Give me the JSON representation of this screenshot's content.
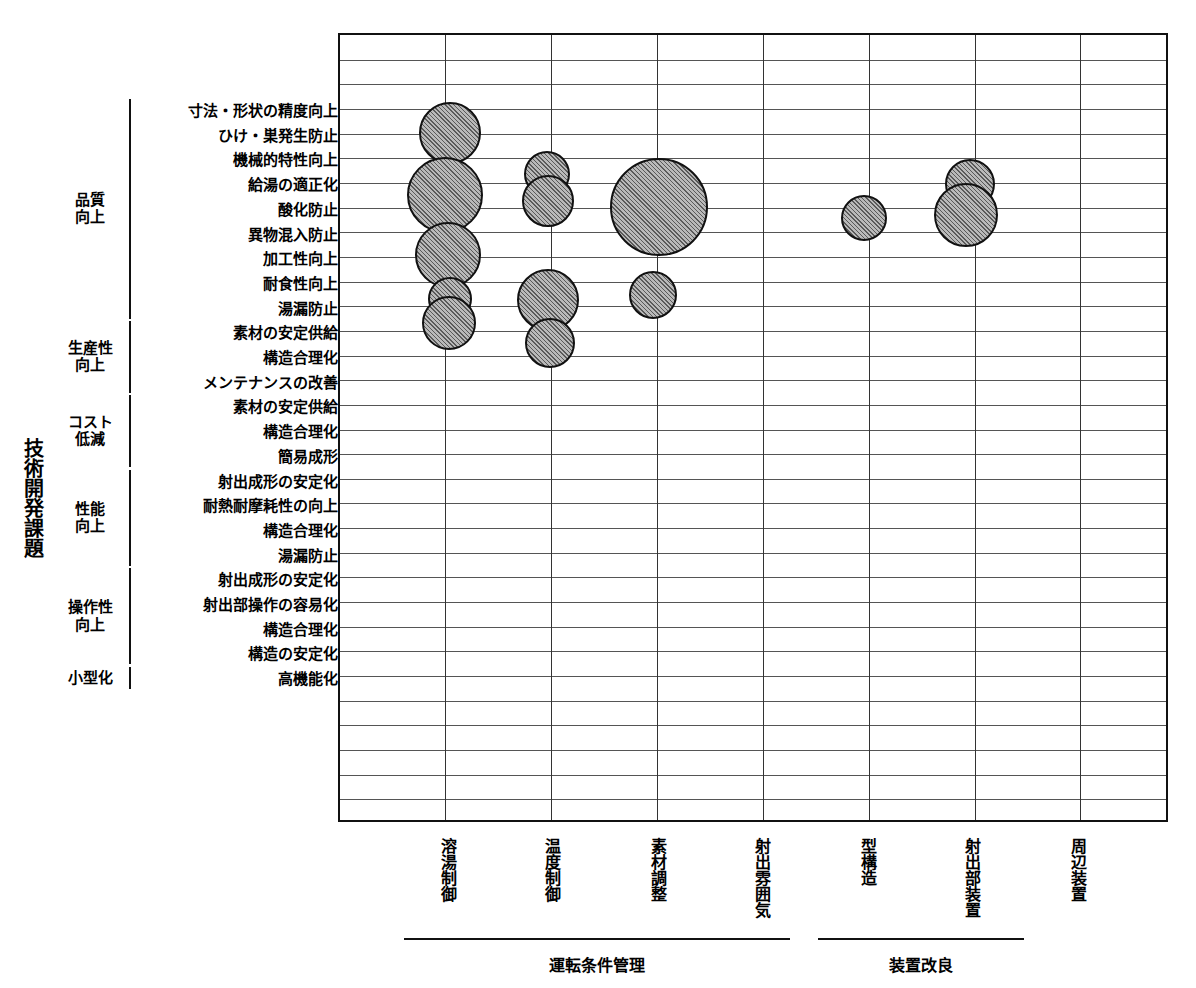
{
  "axis": {
    "y_title": "技術開発課題"
  },
  "row_groups": [
    {
      "label": "品質\n向上",
      "start_row": 1,
      "end_row": 9
    },
    {
      "label": "生産性\n向上",
      "start_row": 10,
      "end_row": 12
    },
    {
      "label": "コスト\n低減",
      "start_row": 13,
      "end_row": 15
    },
    {
      "label": "性能\n向上",
      "start_row": 16,
      "end_row": 19
    },
    {
      "label": "操作性\n向上",
      "start_row": 20,
      "end_row": 23
    },
    {
      "label": "小型化",
      "start_row": 24,
      "end_row": 24
    }
  ],
  "rows": [
    {
      "index": 1,
      "label": "寸法・形状の精度向上"
    },
    {
      "index": 2,
      "label": "ひけ・巣発生防止"
    },
    {
      "index": 3,
      "label": "機械的特性向上"
    },
    {
      "index": 4,
      "label": "給湯の適正化"
    },
    {
      "index": 5,
      "label": "酸化防止"
    },
    {
      "index": 6,
      "label": "異物混入防止"
    },
    {
      "index": 7,
      "label": "加工性向上"
    },
    {
      "index": 8,
      "label": "耐食性向上"
    },
    {
      "index": 9,
      "label": "湯漏防止"
    },
    {
      "index": 10,
      "label": "素材の安定供給"
    },
    {
      "index": 11,
      "label": "構造合理化"
    },
    {
      "index": 12,
      "label": "メンテナンスの改善"
    },
    {
      "index": 13,
      "label": "素材の安定供給"
    },
    {
      "index": 14,
      "label": "構造合理化"
    },
    {
      "index": 15,
      "label": "簡易成形"
    },
    {
      "index": 16,
      "label": "射出成形の安定化"
    },
    {
      "index": 17,
      "label": "耐熱耐摩耗性の向上"
    },
    {
      "index": 18,
      "label": "構造合理化"
    },
    {
      "index": 19,
      "label": "湯漏防止"
    },
    {
      "index": 20,
      "label": "射出成形の安定化"
    },
    {
      "index": 21,
      "label": "射出部操作の容易化"
    },
    {
      "index": 22,
      "label": "構造合理化"
    },
    {
      "index": 23,
      "label": "構造の安定化"
    },
    {
      "index": 24,
      "label": "高機能化"
    }
  ],
  "columns": [
    {
      "index": 1,
      "label": "溶湯制御"
    },
    {
      "index": 2,
      "label": "温度制御"
    },
    {
      "index": 3,
      "label": "素材調整"
    },
    {
      "index": 4,
      "label": "射出雰囲気"
    },
    {
      "index": 5,
      "label": "型構造"
    },
    {
      "index": 6,
      "label": "射出部装置"
    },
    {
      "index": 7,
      "label": "周辺装置"
    }
  ],
  "column_groups": [
    {
      "label": "運転条件管理",
      "start_col": 1,
      "end_col": 4
    },
    {
      "label": "装置改良",
      "start_col": 5,
      "end_col": 6
    }
  ],
  "chart_data": {
    "type": "scatter",
    "title": "",
    "xlabel": "",
    "ylabel": "技術開発課題",
    "grid": true,
    "legend": "none",
    "note": "bubble-matrix: bubble area encodes number of patent applications per (課題 row × 手段 column) cell",
    "categories_x": [
      "溶湯制御",
      "温度制御",
      "素材調整",
      "射出雰囲気",
      "型構造",
      "射出部装置",
      "周辺装置"
    ],
    "categories_y": [
      "寸法・形状の精度向上",
      "ひけ・巣発生防止",
      "機械的特性向上",
      "給湯の適正化",
      "酸化防止",
      "異物混入防止",
      "加工性向上",
      "耐食性向上",
      "湯漏防止",
      "素材の安定供給",
      "構造合理化",
      "メンテナンスの改善",
      "素材の安定供給",
      "構造合理化",
      "簡易成形",
      "射出成形の安定化",
      "耐熱耐摩耗性の向上",
      "構造合理化",
      "湯漏防止",
      "射出成形の安定化",
      "射出部操作の容易化",
      "構造合理化",
      "構造の安定化",
      "高機能化"
    ],
    "bubbles": [
      {
        "x": "溶湯制御",
        "y": "寸法・形状の精度向上",
        "col": 1,
        "row": 1,
        "r": 31,
        "cx": 448,
        "cy": 131
      },
      {
        "x": "溶湯制御",
        "y": "機械的特性向上",
        "col": 1,
        "row": 3,
        "r": 38,
        "cx": 443,
        "cy": 193
      },
      {
        "x": "溶湯制御",
        "y": "酸化防止",
        "col": 1,
        "row": 5,
        "r": 33,
        "cx": 446,
        "cy": 253
      },
      {
        "x": "溶湯制御",
        "y": "加工性向上",
        "col": 1,
        "row": 7,
        "r": 22,
        "cx": 448,
        "cy": 297
      },
      {
        "x": "溶湯制御",
        "y": "湯漏防止",
        "col": 1,
        "row": 9,
        "r": 27,
        "cx": 447,
        "cy": 321
      },
      {
        "x": "温度制御",
        "y": "ひけ・巣発生防止",
        "col": 2,
        "row": 2,
        "r": 23,
        "cx": 545,
        "cy": 172
      },
      {
        "x": "温度制御",
        "y": "給湯の適正化",
        "col": 2,
        "row": 4,
        "r": 26,
        "cx": 546,
        "cy": 199
      },
      {
        "x": "温度制御",
        "y": "加工性向上",
        "col": 2,
        "row": 7,
        "r": 31,
        "cx": 546,
        "cy": 298
      },
      {
        "x": "温度制御",
        "y": "湯漏防止",
        "col": 2,
        "row": 9,
        "r": 25,
        "cx": 548,
        "cy": 341
      },
      {
        "x": "素材調整",
        "y": "給湯の適正化",
        "col": 3,
        "row": 4,
        "r": 49,
        "cx": 657,
        "cy": 205
      },
      {
        "x": "素材調整",
        "y": "加工性向上",
        "col": 3,
        "row": 7,
        "r": 24,
        "cx": 651,
        "cy": 293
      },
      {
        "x": "型構造",
        "y": "酸化防止",
        "col": 5,
        "row": 5,
        "r": 23,
        "cx": 862,
        "cy": 216
      },
      {
        "x": "射出部装置",
        "y": "機械的特性向上",
        "col": 6,
        "row": 3,
        "r": 25,
        "cx": 968,
        "cy": 182
      },
      {
        "x": "射出部装置",
        "y": "酸化防止",
        "col": 6,
        "row": 5,
        "r": 32,
        "cx": 964,
        "cy": 213
      }
    ]
  }
}
